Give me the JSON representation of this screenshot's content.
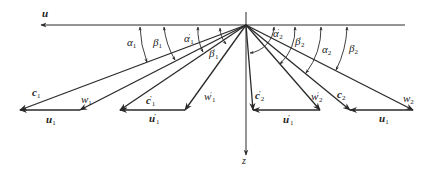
{
  "diagram": {
    "type": "velocity-triangles",
    "colors": {
      "line": "#2a2a2a",
      "text": "#222222",
      "background": "#ffffff"
    },
    "origin": {
      "x": 246,
      "y": 25
    },
    "axes": {
      "u": {
        "label": "u",
        "from": [
          405,
          25
        ],
        "to": [
          40,
          25
        ]
      },
      "z": {
        "label": "z",
        "from": [
          246,
          12
        ],
        "to": [
          246,
          155
        ]
      }
    },
    "triangles": [
      {
        "id": "inlet-1",
        "c": {
          "label": "c",
          "sub": "1",
          "sup": "",
          "end": [
            20,
            110
          ]
        },
        "w": {
          "label": "w",
          "sub": "1",
          "sup": "",
          "end": [
            80,
            110
          ]
        },
        "u": {
          "label": "u",
          "sub": "1",
          "sup": "",
          "from": [
            80,
            110
          ],
          "to": [
            20,
            110
          ]
        }
      },
      {
        "id": "inlet-1-prime",
        "c": {
          "label": "c",
          "sub": "1",
          "sup": "′",
          "end": [
            120,
            110
          ]
        },
        "w": {
          "label": "w",
          "sub": "1",
          "sup": "′",
          "end": [
            185,
            110
          ]
        },
        "u": {
          "label": "u",
          "sub": "1",
          "sup": "′",
          "from": [
            185,
            110
          ],
          "to": [
            120,
            110
          ]
        }
      },
      {
        "id": "outlet-2-prime",
        "c": {
          "label": "c",
          "sub": "2",
          "sup": "′",
          "end": [
            253,
            110
          ]
        },
        "w": {
          "label": "w",
          "sub": "2",
          "sup": "′",
          "end": [
            320,
            110
          ]
        },
        "u": {
          "label": "u",
          "sub": "1",
          "sup": "′",
          "from": [
            320,
            110
          ],
          "to": [
            253,
            110
          ]
        }
      },
      {
        "id": "outlet-2",
        "c": {
          "label": "c",
          "sub": "2",
          "sup": "",
          "end": [
            350,
            110
          ]
        },
        "w": {
          "label": "w",
          "sub": "2",
          "sup": "",
          "end": [
            413,
            110
          ]
        },
        "u": {
          "label": "u",
          "sub": "1",
          "sup": "",
          "from": [
            413,
            110
          ],
          "to": [
            350,
            110
          ]
        }
      }
    ],
    "angles": [
      {
        "symbol": "α",
        "sub": "1",
        "sup": ""
      },
      {
        "symbol": "β",
        "sub": "1",
        "sup": ""
      },
      {
        "symbol": "α",
        "sub": "1",
        "sup": "′"
      },
      {
        "symbol": "β",
        "sub": "1",
        "sup": "′"
      },
      {
        "symbol": "α",
        "sub": "2",
        "sup": "′"
      },
      {
        "symbol": "β",
        "sub": "2",
        "sup": "′"
      },
      {
        "symbol": "α",
        "sub": "2",
        "sup": ""
      },
      {
        "symbol": "β",
        "sub": "2",
        "sup": ""
      }
    ]
  }
}
